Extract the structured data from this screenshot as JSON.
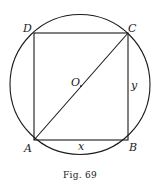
{
  "figure": {
    "caption": "Fig. 69",
    "colors": {
      "stroke": "#1a1a1a",
      "background": "#ffffff"
    },
    "circle": {
      "center": "O",
      "cx": 80,
      "cy": 84,
      "r": 70
    },
    "square": {
      "vertices": [
        {
          "label": "A",
          "x": 34,
          "y": 140
        },
        {
          "label": "B",
          "x": 128,
          "y": 140
        },
        {
          "label": "C",
          "x": 128,
          "y": 33
        },
        {
          "label": "D",
          "x": 34,
          "y": 33
        }
      ]
    },
    "diagonal": {
      "from": "A",
      "to": "C"
    },
    "labels": {
      "A": "A",
      "B": "B",
      "C": "C",
      "D": "D",
      "O": "O",
      "x": "x",
      "y": "y"
    }
  }
}
